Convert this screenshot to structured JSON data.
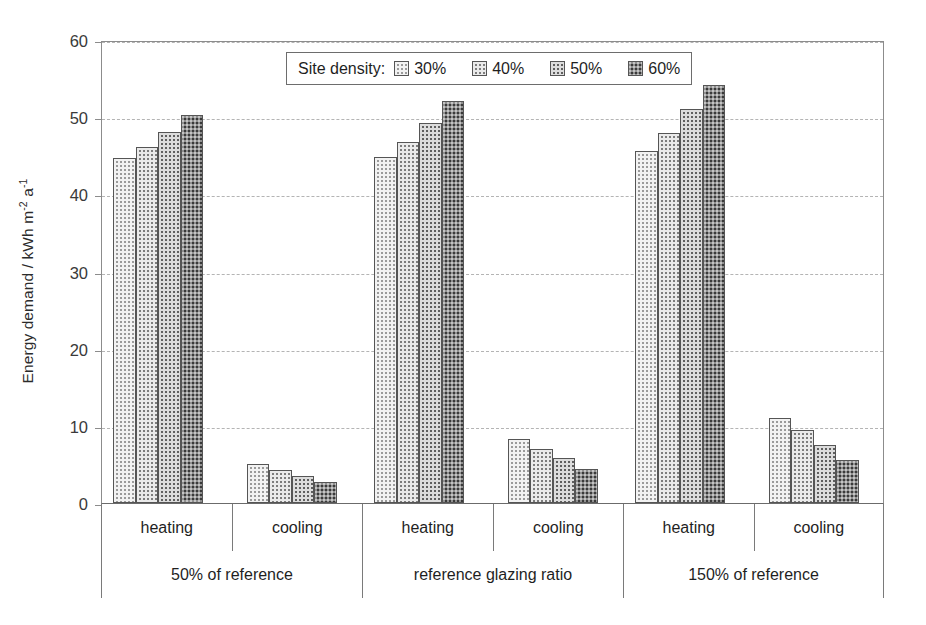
{
  "chart_data": {
    "type": "bar",
    "title": "",
    "xlabel": "",
    "ylabel": "Energy demand / kWh m-2 a-1",
    "ylabel_parts": {
      "base": "Energy demand / kWh m",
      "sup1": "-2",
      "mid": " a",
      "sup2": "-1"
    },
    "ylim": [
      0,
      60
    ],
    "yticks": [
      0,
      10,
      20,
      30,
      40,
      50,
      60
    ],
    "ytick_labels": [
      "0",
      "10",
      "20",
      "30",
      "40",
      "50",
      "60"
    ],
    "grid": "horizontal-dashed",
    "legend_position": "top-center-inside",
    "legend_title": "Site density:",
    "series": [
      {
        "name": "30%",
        "pattern": "light-dotted",
        "values": [
          44.7,
          5.0,
          44.9,
          8.3,
          45.6,
          11.0
        ]
      },
      {
        "name": "40%",
        "pattern": "medium-light-dotted",
        "values": [
          46.1,
          4.3,
          46.8,
          7.0,
          48.0,
          9.4
        ]
      },
      {
        "name": "50%",
        "pattern": "medium-dark-dotted",
        "values": [
          48.1,
          3.5,
          49.2,
          5.8,
          51.0,
          7.5
        ]
      },
      {
        "name": "60%",
        "pattern": "dark-dotted",
        "values": [
          50.3,
          2.7,
          52.1,
          4.4,
          54.2,
          5.6
        ]
      }
    ],
    "categories": [
      "heating / 50% of reference",
      "cooling / 50% of reference",
      "heating / reference glazing ratio",
      "cooling / reference glazing ratio",
      "heating / 150% of reference",
      "cooling / 150% of reference"
    ],
    "subgroup_labels": [
      "heating",
      "cooling",
      "heating",
      "cooling",
      "heating",
      "cooling"
    ],
    "group_labels": [
      "50% of reference",
      "reference glazing ratio",
      "150% of reference"
    ]
  },
  "legend": {
    "title": "Site density:",
    "entries": [
      {
        "label": "30%"
      },
      {
        "label": "40%"
      },
      {
        "label": "50%"
      },
      {
        "label": "60%"
      }
    ]
  },
  "axes": {
    "y_title_base": "Energy demand / kWh m",
    "y_title_sup1": "-2",
    "y_title_mid": " a",
    "y_title_sup2": "-1",
    "y_tick_labels": [
      "60",
      "50",
      "40",
      "30",
      "20",
      "10",
      "0"
    ]
  },
  "x_axis": {
    "subgroups": [
      "heating",
      "cooling",
      "heating",
      "cooling",
      "heating",
      "cooling"
    ],
    "groups": [
      "50% of reference",
      "reference glazing ratio",
      "150% of reference"
    ]
  },
  "colors": {
    "background": "#ffffff",
    "axis": "#8c8c8c",
    "gridline": "#b4b4b4",
    "bar_outline": "#555555",
    "text": "#1f1f1f",
    "series_30": "#f2f2f2",
    "series_40": "#eaeaea",
    "series_50": "#dcdcdc",
    "series_60": "#c4c4c4"
  }
}
